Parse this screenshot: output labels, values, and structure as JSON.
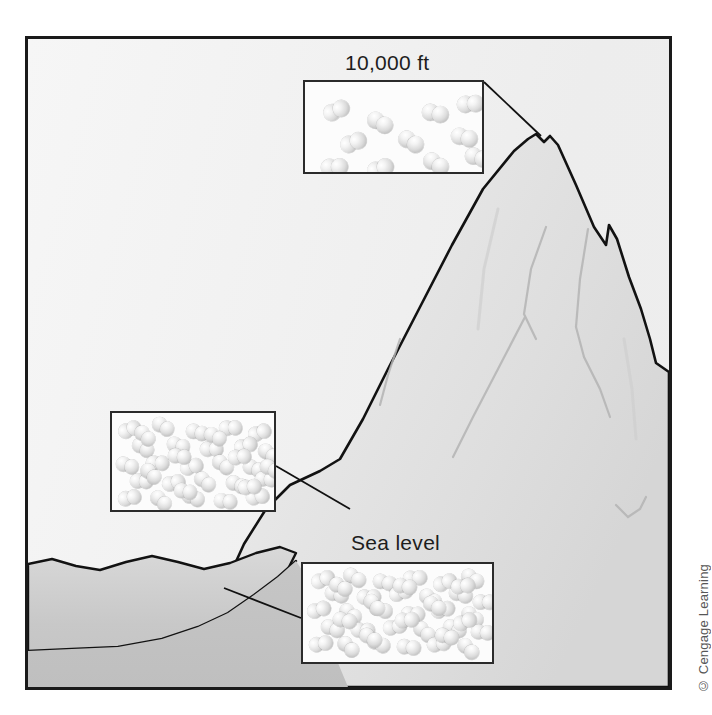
{
  "figure": {
    "credit": "© Cengage Learning",
    "border_color": "#1a1a1a",
    "sky_color": "#f1f1f1",
    "mountain_fill": "#e4e4e4",
    "mountain_outline": "#101010",
    "foreground_fill": "#c9c9c9"
  },
  "labels": {
    "altitude_high": "10,000 ft",
    "sea_level": "Sea level"
  },
  "callouts": [
    {
      "id": "box-top",
      "name": "callout-10000ft",
      "label": "10,000 ft",
      "molecule_count": 11,
      "density": "sparse",
      "x": 275,
      "y": 41,
      "w": 181,
      "h": 94,
      "molecules": [
        {
          "x": 18,
          "y": 20
        },
        {
          "x": 62,
          "y": 31
        },
        {
          "x": 117,
          "y": 22
        },
        {
          "x": 152,
          "y": 13
        },
        {
          "x": 35,
          "y": 52
        },
        {
          "x": 93,
          "y": 50
        },
        {
          "x": 146,
          "y": 46
        },
        {
          "x": 16,
          "y": 76
        },
        {
          "x": 62,
          "y": 78
        },
        {
          "x": 118,
          "y": 72
        },
        {
          "x": 160,
          "y": 66
        }
      ]
    },
    {
      "id": "box-mid",
      "name": "callout-midslope",
      "label": "",
      "molecule_count": 33,
      "density": "medium",
      "x": 82,
      "y": 372,
      "w": 166,
      "h": 101,
      "molecules": [
        {
          "x": 6,
          "y": 9
        },
        {
          "x": 40,
          "y": 5
        },
        {
          "x": 74,
          "y": 11
        },
        {
          "x": 107,
          "y": 7
        },
        {
          "x": 136,
          "y": 12
        },
        {
          "x": 20,
          "y": 26
        },
        {
          "x": 55,
          "y": 24
        },
        {
          "x": 88,
          "y": 28
        },
        {
          "x": 122,
          "y": 25
        },
        {
          "x": 146,
          "y": 32
        },
        {
          "x": 4,
          "y": 44
        },
        {
          "x": 34,
          "y": 42
        },
        {
          "x": 68,
          "y": 46
        },
        {
          "x": 100,
          "y": 43
        },
        {
          "x": 131,
          "y": 47
        },
        {
          "x": 18,
          "y": 60
        },
        {
          "x": 50,
          "y": 62
        },
        {
          "x": 82,
          "y": 60
        },
        {
          "x": 114,
          "y": 63
        },
        {
          "x": 143,
          "y": 58
        },
        {
          "x": 6,
          "y": 77
        },
        {
          "x": 38,
          "y": 79
        },
        {
          "x": 70,
          "y": 76
        },
        {
          "x": 102,
          "y": 80
        },
        {
          "x": 134,
          "y": 76
        },
        {
          "x": 22,
          "y": 14
        },
        {
          "x": 92,
          "y": 15
        },
        {
          "x": 56,
          "y": 35
        },
        {
          "x": 116,
          "y": 36
        },
        {
          "x": 28,
          "y": 52
        },
        {
          "x": 148,
          "y": 47
        },
        {
          "x": 62,
          "y": 70
        },
        {
          "x": 126,
          "y": 66
        }
      ]
    },
    {
      "id": "box-sea",
      "name": "callout-sea-level",
      "label": "Sea level",
      "molecule_count": 40,
      "density": "dense",
      "x": 273,
      "y": 523,
      "w": 193,
      "h": 102,
      "molecules": [
        {
          "x": 8,
          "y": 8
        },
        {
          "x": 40,
          "y": 5
        },
        {
          "x": 70,
          "y": 10
        },
        {
          "x": 100,
          "y": 6
        },
        {
          "x": 130,
          "y": 11
        },
        {
          "x": 158,
          "y": 6
        },
        {
          "x": 22,
          "y": 22
        },
        {
          "x": 54,
          "y": 25
        },
        {
          "x": 86,
          "y": 21
        },
        {
          "x": 116,
          "y": 26
        },
        {
          "x": 146,
          "y": 22
        },
        {
          "x": 170,
          "y": 30
        },
        {
          "x": 4,
          "y": 38
        },
        {
          "x": 36,
          "y": 41
        },
        {
          "x": 66,
          "y": 37
        },
        {
          "x": 98,
          "y": 42
        },
        {
          "x": 128,
          "y": 38
        },
        {
          "x": 158,
          "y": 44
        },
        {
          "x": 18,
          "y": 56
        },
        {
          "x": 48,
          "y": 58
        },
        {
          "x": 80,
          "y": 55
        },
        {
          "x": 110,
          "y": 59
        },
        {
          "x": 140,
          "y": 56
        },
        {
          "x": 168,
          "y": 60
        },
        {
          "x": 6,
          "y": 72
        },
        {
          "x": 34,
          "y": 74
        },
        {
          "x": 64,
          "y": 71
        },
        {
          "x": 94,
          "y": 75
        },
        {
          "x": 124,
          "y": 72
        },
        {
          "x": 154,
          "y": 76
        },
        {
          "x": 26,
          "y": 14
        },
        {
          "x": 90,
          "y": 14
        },
        {
          "x": 148,
          "y": 14
        },
        {
          "x": 60,
          "y": 32
        },
        {
          "x": 120,
          "y": 33
        },
        {
          "x": 30,
          "y": 48
        },
        {
          "x": 92,
          "y": 48
        },
        {
          "x": 150,
          "y": 50
        },
        {
          "x": 56,
          "y": 65
        },
        {
          "x": 132,
          "y": 64
        }
      ]
    }
  ],
  "leader_lines": [
    {
      "name": "leader-10000ft-to-peak",
      "from": [
        456,
        43
      ],
      "to": [
        513,
        97
      ]
    },
    {
      "name": "leader-mid-to-slope",
      "from": [
        248,
        427
      ],
      "to": [
        320,
        470
      ]
    },
    {
      "name": "leader-sea-to-base",
      "from": [
        273,
        579
      ],
      "to": [
        196,
        549
      ]
    }
  ],
  "chart_data": {
    "type": "diagram",
    "categories": [
      "10,000 ft",
      "Mid-slope",
      "Sea level"
    ],
    "values": [
      11,
      33,
      40
    ],
    "ylabel": "Relative number of gas molecules per unit volume",
    "annotations": [
      "10,000 ft",
      "Sea level"
    ]
  }
}
